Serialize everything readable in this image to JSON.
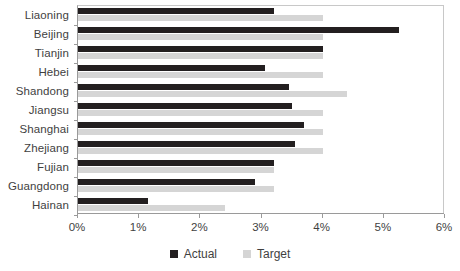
{
  "chart_data": {
    "type": "bar",
    "orientation": "horizontal",
    "title": "",
    "xlabel": "",
    "ylabel": "",
    "xlim": [
      0,
      6
    ],
    "xticks": [
      "0%",
      "1%",
      "2%",
      "3%",
      "4%",
      "5%",
      "6%"
    ],
    "grid": false,
    "legend_position": "bottom-center",
    "categories": [
      "Liaoning",
      "Beijing",
      "Tianjin",
      "Hebei",
      "Shandong",
      "Jiangsu",
      "Shanghai",
      "Zhejiang",
      "Fujian",
      "Guangdong",
      "Hainan"
    ],
    "series": [
      {
        "name": "Actual",
        "color": "#231f20",
        "values": [
          3.2,
          5.25,
          4.0,
          3.05,
          3.45,
          3.5,
          3.7,
          3.55,
          3.2,
          2.9,
          1.15
        ]
      },
      {
        "name": "Target",
        "color": "#d5d5d5",
        "values": [
          4.0,
          4.0,
          4.0,
          4.0,
          4.4,
          4.0,
          4.0,
          4.0,
          3.2,
          3.2,
          2.4
        ]
      }
    ]
  },
  "legend": {
    "items": [
      {
        "label": "Actual",
        "swatch": "actual"
      },
      {
        "label": "Target",
        "swatch": "target"
      }
    ]
  }
}
